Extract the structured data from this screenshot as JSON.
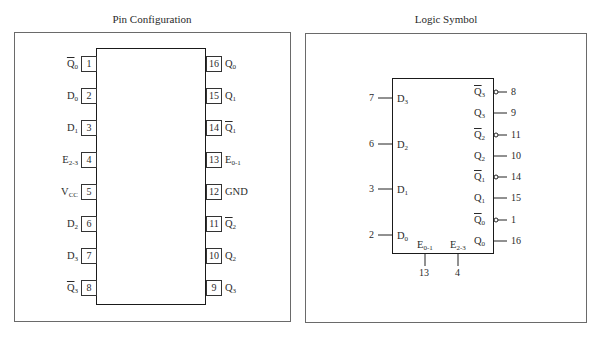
{
  "pin_configuration": {
    "title": "Pin Configuration",
    "left_pins": [
      {
        "number": "1",
        "base": "Q",
        "sub": "0",
        "bar": true
      },
      {
        "number": "2",
        "base": "D",
        "sub": "0",
        "bar": false
      },
      {
        "number": "3",
        "base": "D",
        "sub": "1",
        "bar": false
      },
      {
        "number": "4",
        "base": "E",
        "sub": "2-3",
        "bar": false
      },
      {
        "number": "5",
        "base": "V",
        "sub": "CC",
        "bar": false
      },
      {
        "number": "6",
        "base": "D",
        "sub": "2",
        "bar": false
      },
      {
        "number": "7",
        "base": "D",
        "sub": "3",
        "bar": false
      },
      {
        "number": "8",
        "base": "Q",
        "sub": "3",
        "bar": true
      }
    ],
    "right_pins": [
      {
        "number": "16",
        "base": "Q",
        "sub": "0",
        "bar": false
      },
      {
        "number": "15",
        "base": "Q",
        "sub": "1",
        "bar": false
      },
      {
        "number": "14",
        "base": "Q",
        "sub": "1",
        "bar": true
      },
      {
        "number": "13",
        "base": "E",
        "sub": "0-1",
        "bar": false
      },
      {
        "number": "12",
        "base": "GND",
        "sub": "",
        "bar": false
      },
      {
        "number": "11",
        "base": "Q",
        "sub": "2",
        "bar": true
      },
      {
        "number": "10",
        "base": "Q",
        "sub": "2",
        "bar": false
      },
      {
        "number": "9",
        "base": "Q",
        "sub": "3",
        "bar": false
      }
    ]
  },
  "logic_symbol": {
    "title": "Logic Symbol",
    "inputs": [
      {
        "pin": "7",
        "base": "D",
        "sub": "3"
      },
      {
        "pin": "6",
        "base": "D",
        "sub": "2"
      },
      {
        "pin": "3",
        "base": "D",
        "sub": "1"
      },
      {
        "pin": "2",
        "base": "D",
        "sub": "0"
      }
    ],
    "outputs": [
      {
        "pin": "8",
        "base": "Q",
        "sub": "3",
        "bar": true
      },
      {
        "pin": "9",
        "base": "Q",
        "sub": "3",
        "bar": false
      },
      {
        "pin": "11",
        "base": "Q",
        "sub": "2",
        "bar": true
      },
      {
        "pin": "10",
        "base": "Q",
        "sub": "2",
        "bar": false
      },
      {
        "pin": "14",
        "base": "Q",
        "sub": "1",
        "bar": true
      },
      {
        "pin": "15",
        "base": "Q",
        "sub": "1",
        "bar": false
      },
      {
        "pin": "1",
        "base": "Q",
        "sub": "0",
        "bar": true
      },
      {
        "pin": "16",
        "base": "Q",
        "sub": "0",
        "bar": false
      }
    ],
    "enables": [
      {
        "pin": "13",
        "base": "E",
        "sub": "0-1"
      },
      {
        "pin": "4",
        "base": "E",
        "sub": "2-3"
      }
    ]
  }
}
